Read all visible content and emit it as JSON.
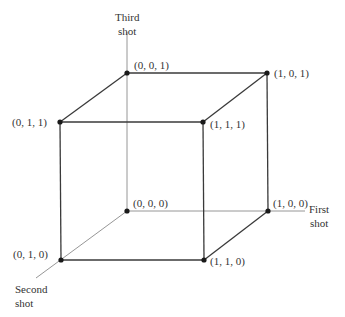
{
  "diagram": {
    "type": "unit-cube",
    "axes": [
      {
        "name": "first",
        "label_line1": "First",
        "label_line2": "shot"
      },
      {
        "name": "second",
        "label_line1": "Second",
        "label_line2": "shot"
      },
      {
        "name": "third",
        "label_line1": "Third",
        "label_line2": "shot"
      }
    ],
    "vertices": {
      "v000": "(0, 0, 0)",
      "v100": "(1, 0, 0)",
      "v010": "(0, 1, 0)",
      "v110": "(1, 1, 0)",
      "v001": "(0, 0, 1)",
      "v101": "(1, 0, 1)",
      "v011": "(0, 1, 1)",
      "v111": "(1, 1, 1)"
    },
    "colors": {
      "line": "#3a3a3a",
      "axis": "#8a8a8a",
      "dot": "#1a1a1a",
      "text": "#333333"
    }
  }
}
